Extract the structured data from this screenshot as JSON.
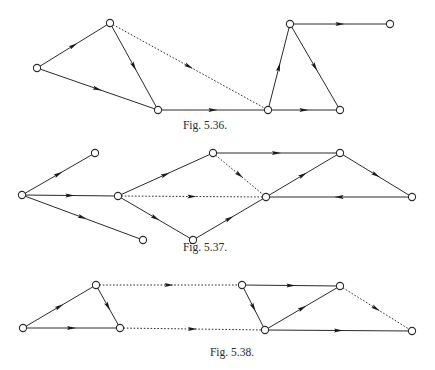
{
  "figures": [
    {
      "id": "fig-5-36",
      "caption": "Fig. 5.36.",
      "caption_pos": {
        "x": 205,
        "y": 119
      },
      "nodes": {
        "A": [
          37,
          68
        ],
        "B": [
          110,
          23
        ],
        "C": [
          158,
          110
        ],
        "D": [
          268,
          110
        ],
        "E": [
          290,
          24
        ],
        "F": [
          390,
          24
        ],
        "G": [
          340,
          110
        ]
      },
      "edges": [
        {
          "from": "A",
          "to": "B",
          "style": "solid"
        },
        {
          "from": "A",
          "to": "C",
          "style": "solid"
        },
        {
          "from": "B",
          "to": "C",
          "style": "solid"
        },
        {
          "from": "B",
          "to": "D",
          "style": "dotted"
        },
        {
          "from": "C",
          "to": "D",
          "style": "solid"
        },
        {
          "from": "D",
          "to": "E",
          "style": "solid"
        },
        {
          "from": "E",
          "to": "F",
          "style": "solid"
        },
        {
          "from": "E",
          "to": "G",
          "style": "solid"
        },
        {
          "from": "D",
          "to": "G",
          "style": "solid"
        }
      ]
    },
    {
      "id": "fig-5-37",
      "caption": "Fig. 5.37.",
      "caption_pos": {
        "x": 205,
        "y": 241
      },
      "nodes": {
        "H": [
          22,
          195
        ],
        "I": [
          95,
          153
        ],
        "J": [
          118,
          196
        ],
        "K": [
          143,
          240
        ],
        "L": [
          213,
          153
        ],
        "M": [
          193,
          240
        ],
        "N": [
          266,
          197
        ],
        "O": [
          340,
          153
        ],
        "P": [
          412,
          197
        ]
      },
      "edges": [
        {
          "from": "H",
          "to": "I",
          "style": "solid"
        },
        {
          "from": "H",
          "to": "J",
          "style": "solid"
        },
        {
          "from": "H",
          "to": "K",
          "style": "solid"
        },
        {
          "from": "J",
          "to": "L",
          "style": "solid"
        },
        {
          "from": "J",
          "to": "M",
          "style": "solid"
        },
        {
          "from": "J",
          "to": "N",
          "style": "dotted"
        },
        {
          "from": "L",
          "to": "N",
          "style": "dotted"
        },
        {
          "from": "L",
          "to": "O",
          "style": "solid"
        },
        {
          "from": "M",
          "to": "N",
          "style": "solid"
        },
        {
          "from": "N",
          "to": "O",
          "style": "solid"
        },
        {
          "from": "O",
          "to": "P",
          "style": "solid"
        },
        {
          "from": "P",
          "to": "N",
          "style": "solid"
        }
      ]
    },
    {
      "id": "fig-5-38",
      "caption": "Fig. 5.38.",
      "caption_pos": {
        "x": 232,
        "y": 346
      },
      "nodes": {
        "Q": [
          23,
          328
        ],
        "R": [
          96,
          285
        ],
        "S": [
          120,
          328
        ],
        "T": [
          242,
          285
        ],
        "U": [
          265,
          330
        ],
        "V": [
          340,
          286
        ],
        "W": [
          412,
          331
        ]
      },
      "edges": [
        {
          "from": "Q",
          "to": "R",
          "style": "solid"
        },
        {
          "from": "Q",
          "to": "S",
          "style": "solid"
        },
        {
          "from": "R",
          "to": "S",
          "style": "solid"
        },
        {
          "from": "R",
          "to": "T",
          "style": "dotted"
        },
        {
          "from": "S",
          "to": "U",
          "style": "dotted"
        },
        {
          "from": "T",
          "to": "U",
          "style": "solid"
        },
        {
          "from": "T",
          "to": "V",
          "style": "solid"
        },
        {
          "from": "U",
          "to": "V",
          "style": "solid"
        },
        {
          "from": "U",
          "to": "W",
          "style": "solid"
        },
        {
          "from": "V",
          "to": "W",
          "style": "dotted"
        }
      ]
    }
  ]
}
